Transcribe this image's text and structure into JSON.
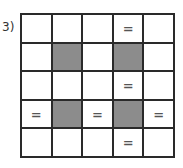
{
  "label": "3)",
  "grid": {
    "rows": 5,
    "cols": 5,
    "shaded_color": "#8c8c8c",
    "cells": [
      [
        "",
        "",
        "",
        "=",
        ""
      ],
      [
        "",
        "#",
        "",
        "#",
        ""
      ],
      [
        "",
        "",
        "",
        "=",
        ""
      ],
      [
        "=",
        "#",
        "=",
        "#",
        "="
      ],
      [
        "",
        "",
        "",
        "=",
        ""
      ]
    ]
  }
}
